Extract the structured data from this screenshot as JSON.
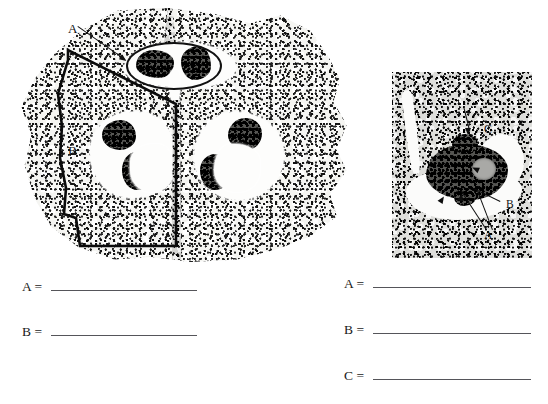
{
  "worksheet": {
    "title": "Micrograph labeling worksheet",
    "background_color": "#ffffff",
    "ink_color": "#111111"
  },
  "figures": [
    {
      "id": "ovary-cross-section",
      "name": "ovary-cross-section-micrograph",
      "caption": "",
      "position": {
        "x": 18,
        "y": 8,
        "width": 332,
        "height": 254
      },
      "annotations": [
        {
          "label": "A",
          "marker": "ellipse-with-leader-arrow",
          "label_position": {
            "x": 68,
            "y": 22
          },
          "target_description": "single ovule circled in the upper locule"
        },
        {
          "label": "B",
          "marker": "bold-wedge-outline",
          "label_position": {
            "x": 68,
            "y": 144
          },
          "target_description": "outlined wedge-shaped carpel region on the left"
        }
      ]
    },
    {
      "id": "ovule-closeup",
      "name": "ovule-closeup-micrograph",
      "caption": "",
      "position": {
        "x": 392,
        "y": 72,
        "width": 140,
        "height": 186
      },
      "annotations": [
        {
          "label": "C",
          "marker": "arrow",
          "label_position": {
            "x": 484,
            "y": 126
          },
          "target_description": "upper structure of the ovule"
        },
        {
          "label": "B",
          "marker": "arrow",
          "label_position": {
            "x": 506,
            "y": 200
          },
          "target_description": "right-hand structure of the ovule"
        },
        {
          "label": "A",
          "marker": "double-arrow",
          "label_position": {
            "x": 484,
            "y": 231
          },
          "target_description": "lower structures of the ovule"
        }
      ]
    }
  ],
  "answers": {
    "left_column": {
      "name": "left-answer-column",
      "rows": [
        {
          "key": "A =",
          "value": ""
        },
        {
          "key": "B =",
          "value": ""
        }
      ]
    },
    "right_column": {
      "name": "right-answer-column",
      "rows": [
        {
          "key": "A =",
          "value": ""
        },
        {
          "key": "B =",
          "value": ""
        },
        {
          "key": "C =",
          "value": ""
        }
      ]
    }
  }
}
